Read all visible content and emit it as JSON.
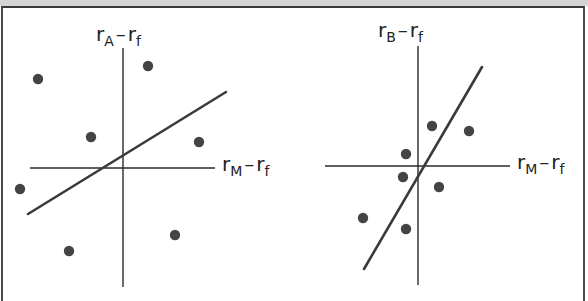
{
  "colors": {
    "axis": "#2a2a2a",
    "line": "#3a3a3a",
    "point": "#444444",
    "frame": "#3a3a3a",
    "top_band": "#d4d4d4"
  },
  "panels": [
    {
      "id": "A",
      "y_label": {
        "base": "r",
        "sub": "A",
        "dash": "–",
        "base2": "r",
        "sub2": "f"
      },
      "x_label": {
        "base": "r",
        "sub": "M",
        "dash": "–",
        "base2": "r",
        "sub2": "f"
      },
      "y_axis": {
        "x": 123,
        "y1": 48,
        "y2": 287
      },
      "x_axis": {
        "y": 168,
        "x1": 30,
        "x2": 215
      },
      "regression_line": {
        "x1": 28,
        "y1": 214,
        "x2": 226,
        "y2": 92
      },
      "points": [
        [
          38,
          79
        ],
        [
          148,
          66
        ],
        [
          91,
          137
        ],
        [
          199,
          142
        ],
        [
          20,
          189
        ],
        [
          175,
          235
        ],
        [
          69,
          251
        ]
      ]
    },
    {
      "id": "B",
      "y_label": {
        "base": "r",
        "sub": "B",
        "dash": "–",
        "base2": "r",
        "sub2": "f"
      },
      "x_label": {
        "base": "r",
        "sub": "M",
        "dash": "–",
        "base2": "r",
        "sub2": "f"
      },
      "y_axis": {
        "x": 418,
        "y1": 46,
        "y2": 285
      },
      "x_axis": {
        "y": 166,
        "x1": 325,
        "x2": 510
      },
      "regression_line": {
        "x1": 364,
        "y1": 269,
        "x2": 482,
        "y2": 67
      },
      "points": [
        [
          406,
          154
        ],
        [
          432,
          126
        ],
        [
          469,
          131
        ],
        [
          403,
          177
        ],
        [
          439,
          187
        ],
        [
          363,
          218
        ],
        [
          406,
          229
        ]
      ]
    }
  ],
  "chart_data": [
    {
      "type": "scatter",
      "title": "Stock A excess returns vs market excess returns",
      "xlabel": "rM − rf",
      "ylabel": "rA − rf",
      "grid": false,
      "note": "Low slope (beta), wide scatter — low R²",
      "points_relative_to_origin": [
        [
          -85,
          89
        ],
        [
          25,
          102
        ],
        [
          -32,
          31
        ],
        [
          76,
          26
        ],
        [
          -103,
          -21
        ],
        [
          52,
          -67
        ],
        [
          -54,
          -83
        ]
      ],
      "fit_line": {
        "slope": 0.62,
        "intercept_px": 11
      }
    },
    {
      "type": "scatter",
      "title": "Stock B excess returns vs market excess returns",
      "xlabel": "rM − rf",
      "ylabel": "rB − rf",
      "grid": false,
      "note": "Steep slope (high beta), tight scatter — high R²",
      "points_relative_to_origin": [
        [
          -12,
          12
        ],
        [
          14,
          40
        ],
        [
          51,
          35
        ],
        [
          -15,
          -11
        ],
        [
          21,
          -21
        ],
        [
          -55,
          -52
        ],
        [
          -12,
          -63
        ]
      ],
      "fit_line": {
        "slope": 1.71,
        "intercept_px": -10
      }
    }
  ]
}
